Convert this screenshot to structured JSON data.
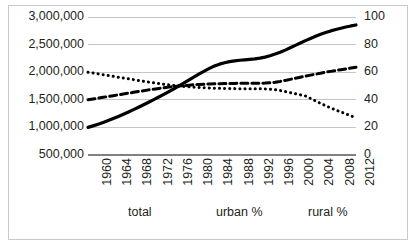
{
  "chart_data": {
    "type": "line",
    "title": "",
    "subtitle": "",
    "xlabel": "",
    "ylabel": "",
    "y2label": "",
    "grid": true,
    "legend_position": "bottom",
    "x": [
      1960,
      1961,
      1962,
      1963,
      1964,
      1965,
      1966,
      1967,
      1968,
      1969,
      1970,
      1971,
      1972,
      1973,
      1974,
      1975,
      1976,
      1977,
      1978,
      1979,
      1980,
      1981,
      1982,
      1983,
      1984,
      1985,
      1986,
      1987,
      1988,
      1989,
      1990,
      1991,
      1992,
      1993,
      1994,
      1995,
      1996,
      1997,
      1998,
      1999,
      2000,
      2001,
      2002,
      2003,
      2004,
      2005,
      2006,
      2007,
      2008,
      2009,
      2010,
      2011,
      2012,
      2013
    ],
    "xticks": [
      1960,
      1964,
      1968,
      1972,
      1976,
      1980,
      1984,
      1988,
      1992,
      1996,
      2000,
      2004,
      2008,
      2012
    ],
    "xtick_labels": [
      "1960",
      "1964",
      "1968",
      "1972",
      "1976",
      "1980",
      "1984",
      "1988",
      "1992",
      "1996",
      "2000",
      "2004",
      "2008",
      "2012"
    ],
    "xlim": [
      1960,
      2013
    ],
    "ylim": [
      500000,
      3000000
    ],
    "yticks": [
      500000,
      1000000,
      1500000,
      2000000,
      2500000,
      3000000
    ],
    "ytick_labels": [
      "500,000",
      "1,000,000",
      "1,500,000",
      "2,000,000",
      "2,500,000",
      "3,000,000"
    ],
    "y2lim": [
      0,
      100
    ],
    "y2ticks": [
      0,
      20,
      40,
      60,
      80,
      100
    ],
    "y2tick_labels": [
      "0",
      "20",
      "40",
      "60",
      "80",
      "100"
    ],
    "series": [
      {
        "name": "total",
        "axis": "left",
        "style": "solid",
        "color": "#000000",
        "values": [
          1000000,
          1028000,
          1058000,
          1090000,
          1124000,
          1160000,
          1198000,
          1238000,
          1280000,
          1322000,
          1366000,
          1410000,
          1456000,
          1502000,
          1550000,
          1598000,
          1648000,
          1700000,
          1752000,
          1806000,
          1860000,
          1914000,
          1968000,
          2020000,
          2070000,
          2112000,
          2146000,
          2172000,
          2192000,
          2206000,
          2216000,
          2224000,
          2232000,
          2242000,
          2256000,
          2274000,
          2298000,
          2328000,
          2362000,
          2400000,
          2442000,
          2486000,
          2530000,
          2572000,
          2612000,
          2650000,
          2686000,
          2718000,
          2748000,
          2774000,
          2796000,
          2818000,
          2838000,
          2856000
        ]
      },
      {
        "name": "urban %",
        "axis": "right",
        "style": "dashed",
        "color": "#000000",
        "values": [
          40.0,
          40.6,
          41.2,
          41.8,
          42.4,
          43.0,
          43.6,
          44.2,
          44.8,
          45.4,
          46.0,
          46.6,
          47.2,
          47.7,
          48.2,
          48.7,
          49.2,
          49.6,
          50.0,
          50.3,
          50.6,
          50.9,
          51.1,
          51.3,
          51.5,
          51.6,
          51.7,
          51.8,
          51.9,
          51.9,
          52.0,
          52.0,
          52.0,
          52.0,
          52.0,
          52.1,
          52.3,
          52.7,
          53.3,
          54.0,
          54.8,
          55.6,
          56.4,
          57.2,
          57.9,
          58.6,
          59.3,
          60.0,
          60.6,
          61.2,
          61.8,
          62.4,
          63.0,
          63.6
        ]
      },
      {
        "name": "rural %",
        "axis": "right",
        "style": "dotted",
        "color": "#000000",
        "values": [
          60.0,
          59.4,
          58.8,
          58.2,
          57.6,
          57.0,
          56.4,
          55.8,
          55.2,
          54.6,
          54.0,
          53.4,
          52.8,
          52.3,
          51.8,
          51.3,
          50.8,
          50.4,
          50.0,
          49.7,
          49.4,
          49.1,
          48.9,
          48.7,
          48.5,
          48.4,
          48.3,
          48.2,
          48.1,
          48.1,
          48.0,
          48.0,
          48.0,
          48.0,
          48.0,
          47.9,
          47.7,
          47.3,
          46.7,
          46.0,
          45.2,
          44.4,
          43.6,
          42.8,
          41.0,
          39.2,
          37.4,
          35.7,
          34.1,
          32.6,
          31.2,
          29.8,
          28.4,
          27.0
        ]
      }
    ]
  },
  "axes": {
    "left_ticks": [
      "3,000,000",
      "2,500,000",
      "2,000,000",
      "1,500,000",
      "1,000,000",
      "500,000"
    ],
    "right_ticks": [
      "100",
      "80",
      "60",
      "40",
      "20",
      "0"
    ],
    "x_ticks": [
      "1960",
      "1964",
      "1968",
      "1972",
      "1976",
      "1980",
      "1984",
      "1988",
      "1992",
      "1996",
      "2000",
      "2004",
      "2008",
      "2012"
    ]
  },
  "legend": {
    "items": [
      {
        "label": "total"
      },
      {
        "label": "urban %"
      },
      {
        "label": "rural %"
      }
    ]
  },
  "colors": {
    "series": "#000000",
    "gridline": "#bfbfbf",
    "axis_line": "#808080",
    "frame": "#c9c9c9",
    "text": "#231f20",
    "background": "#ffffff"
  }
}
